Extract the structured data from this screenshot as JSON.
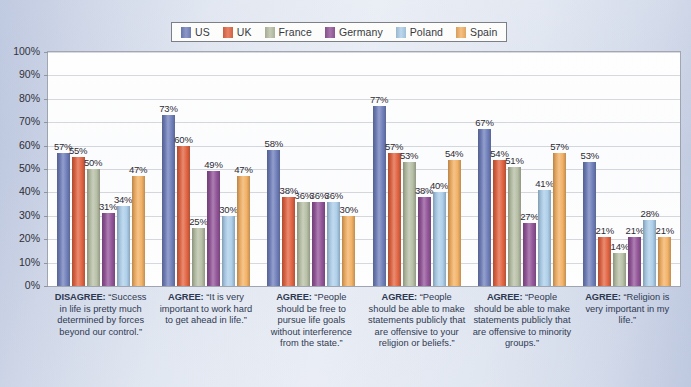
{
  "legend": {
    "position": "top-center",
    "entries": [
      {
        "label": "US",
        "color": "#6878b8"
      },
      {
        "label": "UK",
        "color": "#e35b35"
      },
      {
        "label": "France",
        "color": "#b5bda0"
      },
      {
        "label": "Germany",
        "color": "#8d4a93"
      },
      {
        "label": "Poland",
        "color": "#a9cdea"
      },
      {
        "label": "Spain",
        "color": "#f5ad5a"
      }
    ]
  },
  "y_axis": {
    "ticks": [
      "0%",
      "10%",
      "20%",
      "30%",
      "40%",
      "50%",
      "60%",
      "70%",
      "80%",
      "90%",
      "100%"
    ]
  },
  "chart_data": {
    "type": "bar",
    "title": "",
    "subtitle": "",
    "xlabel": "",
    "ylabel": "",
    "ylim": [
      0,
      100
    ],
    "grid": true,
    "legend_position": "top-center",
    "categories": [
      "DISAGREE: “Success in life is pretty much determined by forces beyond our control.”",
      "AGREE: “It is very important to work hard to get ahead in life.”",
      "AGREE: “People should be free to pursue life goals without interference from the state.”",
      "AGREE: “People should be able to make statements publicly that are offensive to your religion or beliefs.”",
      "AGREE: “People should be able to make statements publicly that are offensive to minority groups.”",
      "AGREE: “Religion is very important in my life.”"
    ],
    "category_parts": [
      {
        "lead": "DISAGREE:",
        "rest": " “Success in life is pretty much determined by forces beyond our control.”"
      },
      {
        "lead": "AGREE:",
        "rest": " “It is very important to work hard to get ahead in life.”"
      },
      {
        "lead": "AGREE:",
        "rest": " “People should be free to pursue life goals without interference from the state.”"
      },
      {
        "lead": "AGREE:",
        "rest": " “People should be able to make statements publicly that are offensive to your religion or beliefs.”"
      },
      {
        "lead": "AGREE:",
        "rest": " “People should be able to make statements publicly that are offensive to minority groups.”"
      },
      {
        "lead": "AGREE:",
        "rest": " “Religion is very important in my life.”"
      }
    ],
    "series": [
      {
        "name": "US",
        "color": "#6878b8",
        "values": [
          57,
          73,
          58,
          77,
          67,
          53
        ]
      },
      {
        "name": "UK",
        "color": "#e35b35",
        "values": [
          55,
          60,
          38,
          57,
          54,
          21
        ]
      },
      {
        "name": "France",
        "color": "#b5bda0",
        "values": [
          50,
          25,
          36,
          53,
          51,
          14
        ]
      },
      {
        "name": "Germany",
        "color": "#8d4a93",
        "values": [
          31,
          49,
          36,
          38,
          27,
          21
        ]
      },
      {
        "name": "Poland",
        "color": "#a9cdea",
        "values": [
          34,
          30,
          36,
          40,
          41,
          28
        ]
      },
      {
        "name": "Spain",
        "color": "#f5ad5a",
        "values": [
          47,
          47,
          30,
          54,
          57,
          21
        ]
      }
    ],
    "value_labels": [
      [
        "57%",
        "55%",
        "50%",
        "31%",
        "34%",
        "47%"
      ],
      [
        "73%",
        "60%",
        "25%",
        "49%",
        "30%",
        "47%"
      ],
      [
        "58%",
        "38%",
        "36%",
        "36%",
        "36%",
        "30%"
      ],
      [
        "77%",
        "57%",
        "53%",
        "38%",
        "40%",
        "54%"
      ],
      [
        "67%",
        "54%",
        "51%",
        "27%",
        "41%",
        "57%"
      ],
      [
        "53%",
        "21%",
        "14%",
        "21%",
        "28%",
        "21%"
      ]
    ]
  }
}
